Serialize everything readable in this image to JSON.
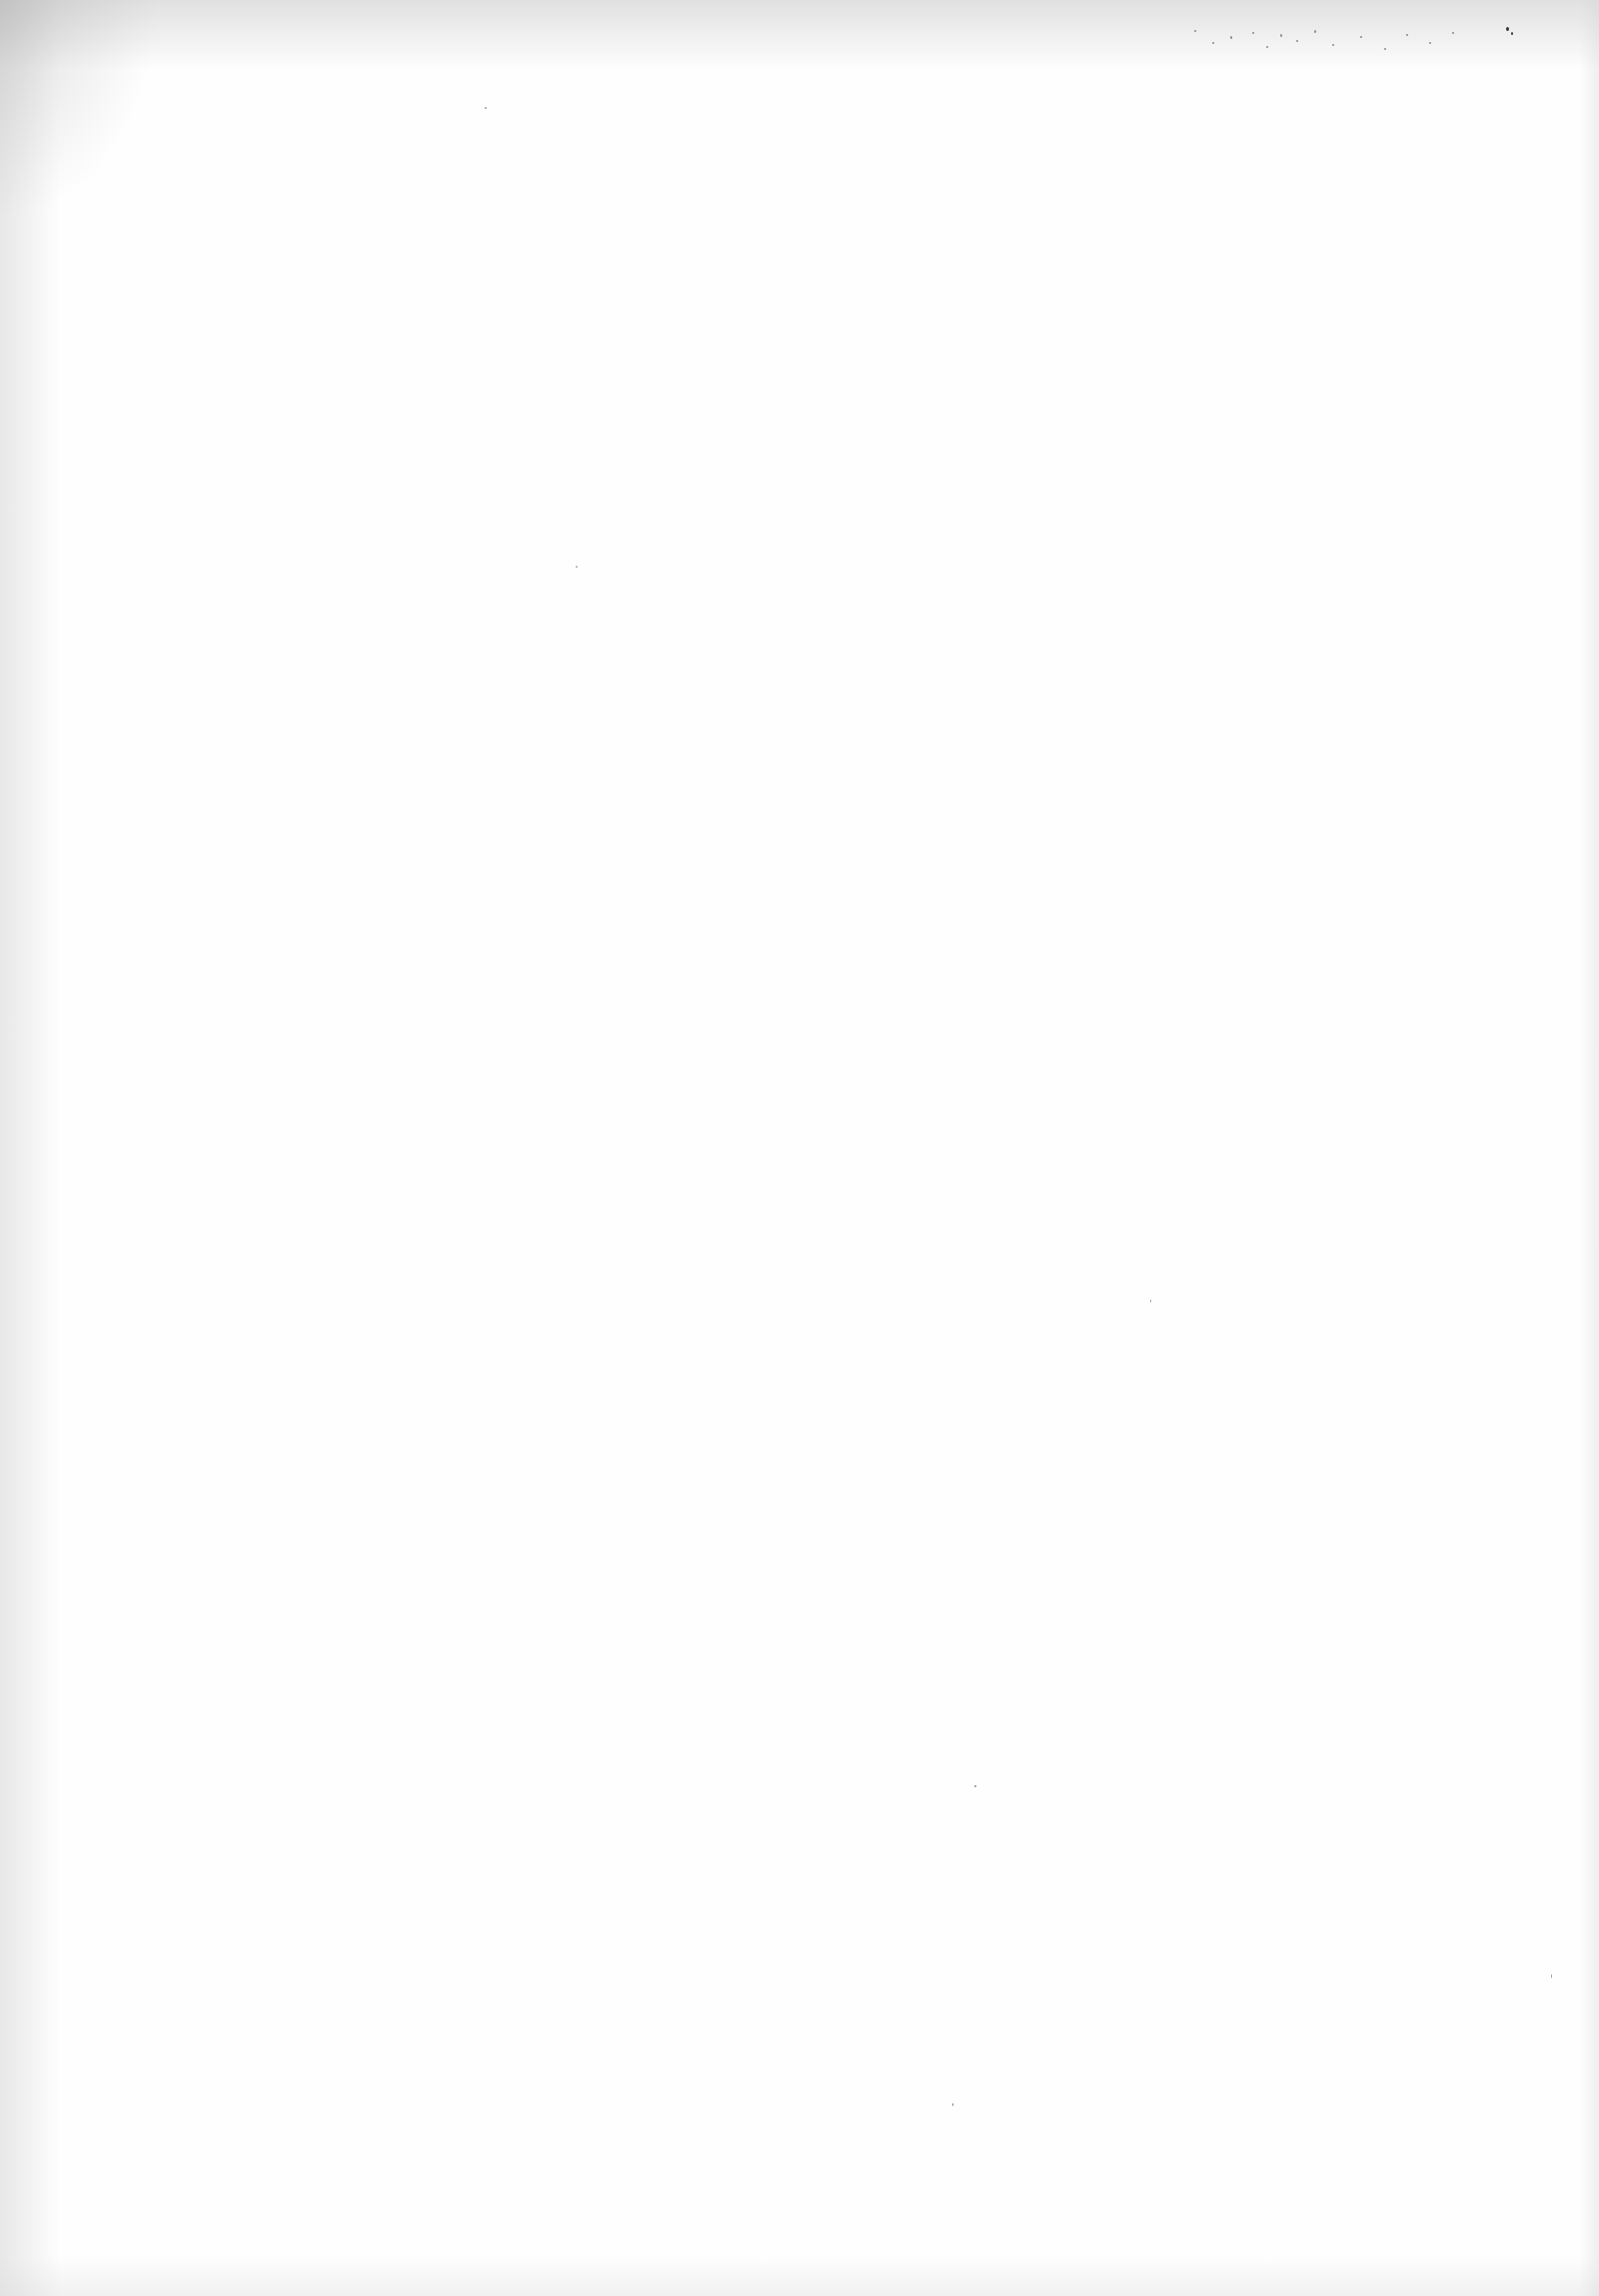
{
  "document": {
    "type": "blank-scanned-page",
    "text": ""
  }
}
